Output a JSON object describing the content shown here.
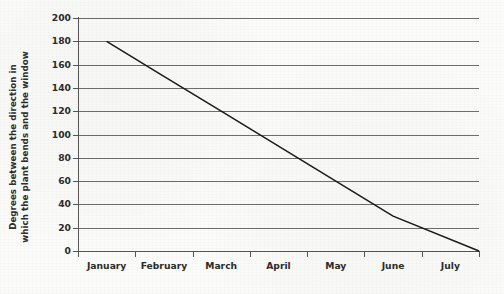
{
  "chart_data": {
    "type": "line",
    "title": "",
    "xlabel": "",
    "ylabel": "Degrees between the direction in\nwhich the plant bends and the window",
    "categories": [
      "January",
      "February",
      "March",
      "April",
      "May",
      "June",
      "July"
    ],
    "x_tick_labels": [
      "January",
      "February",
      "March",
      "April",
      "May",
      "June",
      "July"
    ],
    "y_tick_labels": [
      "0",
      "20",
      "40",
      "60",
      "80",
      "100",
      "120",
      "140",
      "160",
      "180",
      "200"
    ],
    "y_tick_values": [
      0,
      20,
      40,
      60,
      80,
      100,
      120,
      140,
      160,
      180,
      200
    ],
    "ylim": [
      0,
      200
    ],
    "grid": "horizontal",
    "legend": "none",
    "series": [
      {
        "name": "Plant bend angle",
        "values": [
          180,
          150,
          120,
          90,
          60,
          30,
          0
        ],
        "color": "#1a1a1a"
      }
    ]
  },
  "figure": {
    "background_color": "#fbfbfa",
    "axis_color": "#555555",
    "gridline_color": "#6e6e6e"
  }
}
